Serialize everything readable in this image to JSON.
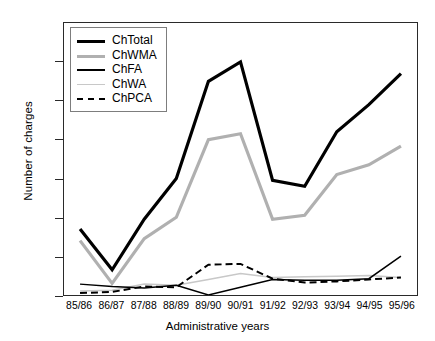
{
  "chart_data": {
    "type": "line",
    "title": "",
    "xlabel": "Administrative years",
    "ylabel": "Number of charges",
    "categories": [
      "85/86",
      "86/87",
      "87/88",
      "88/89",
      "89/90",
      "90/91",
      "91/92",
      "92/93",
      "93/94",
      "94/95",
      "95/96"
    ],
    "ylim": [
      0,
      700
    ],
    "yticks": [
      0,
      100,
      200,
      300,
      400,
      500,
      600,
      700
    ],
    "grid": false,
    "legend_position": "top-left inside plot",
    "series": [
      {
        "name": "ChTotal",
        "color": "#000000",
        "width": 3.2,
        "dash": "solid",
        "values": [
          170,
          65,
          195,
          300,
          550,
          600,
          295,
          280,
          420,
          490,
          570
        ]
      },
      {
        "name": "ChWMA",
        "color": "#b0b0b0",
        "width": 3.2,
        "dash": "solid",
        "values": [
          140,
          30,
          145,
          200,
          400,
          415,
          195,
          205,
          310,
          335,
          383
        ]
      },
      {
        "name": "ChFA",
        "color": "#000000",
        "width": 1.5,
        "dash": "solid",
        "values": [
          28,
          22,
          18,
          25,
          0,
          20,
          40,
          38,
          38,
          42,
          100
        ]
      },
      {
        "name": "ChWA",
        "color": "#c8c8c8",
        "width": 1.5,
        "dash": "solid",
        "values": [
          10,
          12,
          28,
          25,
          40,
          55,
          45,
          47,
          48,
          50,
          45
        ]
      },
      {
        "name": "ChPCA",
        "color": "#000000",
        "width": 2.0,
        "dash": "dashed",
        "values": [
          5,
          8,
          22,
          20,
          78,
          80,
          42,
          32,
          35,
          40,
          45
        ]
      }
    ]
  },
  "axes": {
    "y_title": "Number of charges",
    "x_title": "Administrative years",
    "y_tick_labels": [
      "0",
      "100",
      "200",
      "300",
      "400",
      "500",
      "600",
      "700"
    ],
    "x_tick_labels": [
      "85/86",
      "86/87",
      "87/88",
      "88/89",
      "89/90",
      "90/91",
      "91/92",
      "92/93",
      "93/94",
      "94/95",
      "95/96"
    ]
  },
  "legend": {
    "items": [
      {
        "label": "ChTotal"
      },
      {
        "label": "ChWMA"
      },
      {
        "label": "ChFA"
      },
      {
        "label": "ChWA"
      },
      {
        "label": "ChPCA"
      }
    ]
  },
  "colors": {
    "axis": "#2a2a2a",
    "total": "#000000",
    "wma": "#b0b0b0",
    "fa": "#000000",
    "wa": "#c8c8c8",
    "pca": "#000000",
    "legend_border": "#7d7d7d",
    "background": "#ffffff"
  }
}
